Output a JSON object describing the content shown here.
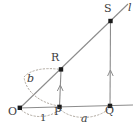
{
  "figure": {
    "kind": "geometry-diagram",
    "colors": {
      "stroke": "#8c8c8c",
      "dotted": "#b0a9a0",
      "point_fill": "#1a1a1a",
      "text": "#3d3d3d",
      "background": "#ffffff"
    },
    "points": [
      {
        "name": "O",
        "label": "O",
        "x": 20,
        "y": 108,
        "label_x": 10,
        "label_y": 112
      },
      {
        "name": "P",
        "label": "P",
        "x": 59,
        "y": 107,
        "label_x": 55,
        "label_y": 112
      },
      {
        "name": "Q",
        "label": "Q",
        "x": 110,
        "y": 106,
        "label_x": 106,
        "label_y": 112
      },
      {
        "name": "R",
        "label": "R",
        "x": 61,
        "y": 69,
        "label_x": 52,
        "label_y": 52
      },
      {
        "name": "S",
        "label": "S",
        "x": 110,
        "y": 21,
        "label_x": 105,
        "label_y": 4
      }
    ],
    "labels": {
      "line_l": "l",
      "arc_b": "b",
      "arc_a": "a",
      "unit": "1"
    },
    "segments": [
      {
        "name": "ray-l",
        "from": "O",
        "to": "line-end",
        "style": "solid"
      },
      {
        "name": "axis-horizontal",
        "from": "O",
        "to": "axis-end",
        "style": "solid"
      },
      {
        "name": "segment-P-R",
        "from": "P",
        "to": "R",
        "style": "solid",
        "arrow": "up"
      },
      {
        "name": "segment-Q-S",
        "from": "Q",
        "to": "S",
        "style": "solid",
        "arrow": "up"
      }
    ],
    "arcs": [
      {
        "name": "arc-b",
        "from": "P",
        "to": "R",
        "style": "dotted",
        "label": "b"
      },
      {
        "name": "arc-a",
        "from": "P",
        "to": "Q",
        "style": "dotted",
        "label": "a"
      },
      {
        "name": "arc-unit",
        "from": "O",
        "to": "P",
        "style": "dotted",
        "label": "1"
      }
    ]
  }
}
